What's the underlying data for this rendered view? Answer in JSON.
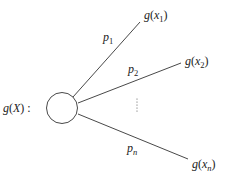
{
  "diagram": {
    "root_label": {
      "func": "g",
      "arg": "X",
      "suffix": ":"
    },
    "branches": [
      {
        "prob": {
          "base": "p",
          "sub": "1"
        },
        "outcome": {
          "func": "g",
          "var": "x",
          "sub": "1"
        }
      },
      {
        "prob": {
          "base": "p",
          "sub": "2"
        },
        "outcome": {
          "func": "g",
          "var": "x",
          "sub": "2"
        }
      },
      {
        "prob": {
          "base": "p",
          "sub": "n"
        },
        "outcome": {
          "func": "g",
          "var": "x",
          "sub": "n"
        }
      }
    ],
    "ellipsis": "⋮"
  }
}
